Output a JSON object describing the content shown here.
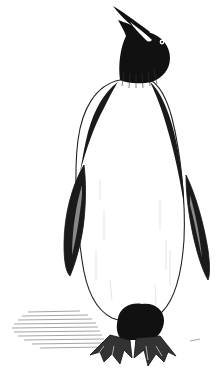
{
  "image": {
    "subject": "emperor penguin",
    "style": "black-and-white pen-and-ink illustration",
    "pose": "standing, head tilted upward",
    "colors": {
      "background": "#ffffff",
      "ink": "#111111",
      "hatch": "#555555",
      "beak_stripe": "#ffffff"
    }
  }
}
